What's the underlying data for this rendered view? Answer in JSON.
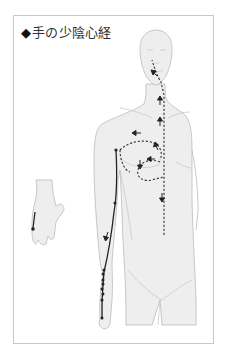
{
  "title": {
    "marker": "◆",
    "text": "手の少陰心経"
  },
  "figure": {
    "meridian_color": "#222222",
    "body_fill": "#eeeeee",
    "body_outline": "#bbbbbb",
    "frame_color": "#c8c8c8"
  }
}
